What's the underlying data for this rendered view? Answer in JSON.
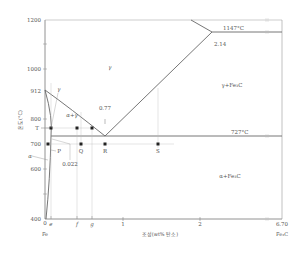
{
  "diagram": {
    "y_axis": {
      "label": "온도(°C)",
      "ticks": [
        {
          "label": "1200",
          "value": 1200
        },
        {
          "label": "1000",
          "value": 1000
        },
        {
          "label": "912",
          "value": 912
        },
        {
          "label": "800",
          "value": 800
        },
        {
          "label": "T",
          "value": 765
        },
        {
          "label": "700",
          "value": 700
        },
        {
          "label": "600",
          "value": 600
        },
        {
          "label": "400",
          "value": 400
        }
      ]
    },
    "x_axis": {
      "label": "조성(wt% 탄소)",
      "left_end": "Fe",
      "right_end": "Fe₃C",
      "ticks": [
        {
          "label": "0",
          "value": 0
        },
        {
          "label": "e",
          "value": 0.08
        },
        {
          "label": "f",
          "value": 0.4
        },
        {
          "label": "g",
          "value": 0.6
        },
        {
          "label": "1",
          "value": 1
        },
        {
          "label": "2",
          "value": 2
        },
        {
          "label": "6.70",
          "value": 6.7
        }
      ]
    },
    "regions": {
      "gamma": "γ",
      "alpha_gamma": "α+γ",
      "gamma_fe3c": "γ+Fe₃C",
      "alpha_fe3c": "α+Fe₃C",
      "alpha": "α",
      "gamma_arrow": "γ"
    },
    "annotations": {
      "eutectic_temp": "1147°C",
      "eutectic_comp": "2.14",
      "eutectoid_temp": "727°C",
      "eutectoid_comp": "0.77",
      "alpha_max": "0.022"
    },
    "points": {
      "P": "P",
      "Q": "Q",
      "R": "R",
      "S": "S"
    }
  }
}
